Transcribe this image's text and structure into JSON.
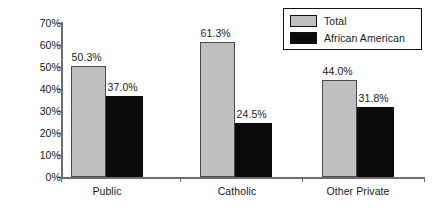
{
  "chart_data": {
    "type": "bar",
    "title": "",
    "subtitle": "",
    "xlabel": "",
    "ylabel": "",
    "categories": [
      "Public",
      "Catholic",
      "Other Private"
    ],
    "series": [
      {
        "name": "Total",
        "color": "#bfbfbf",
        "values": [
          50.3,
          61.3,
          44.0
        ],
        "labels": [
          "50.3%",
          "61.3%",
          "44.0%"
        ]
      },
      {
        "name": "African American",
        "color": "#0a0a0a",
        "values": [
          37.0,
          24.5,
          31.8
        ],
        "labels": [
          "37.0%",
          "24.5%",
          "31.8%"
        ]
      }
    ],
    "ylim": [
      0,
      70
    ],
    "ytick_values": [
      0,
      10,
      20,
      30,
      40,
      50,
      60,
      70
    ],
    "ytick_labels": [
      "0%",
      "10%",
      "20%",
      "30%",
      "40%",
      "50%",
      "60%",
      "70%"
    ],
    "grid": false,
    "legend_position": "top-right",
    "value_labels_shown": true,
    "axis_color": "#6e6e6e",
    "text_color": "#1a1a1a"
  },
  "legend": {
    "items": [
      {
        "label": "Total",
        "color": "#bfbfbf"
      },
      {
        "label": "African American",
        "color": "#0a0a0a"
      }
    ]
  }
}
